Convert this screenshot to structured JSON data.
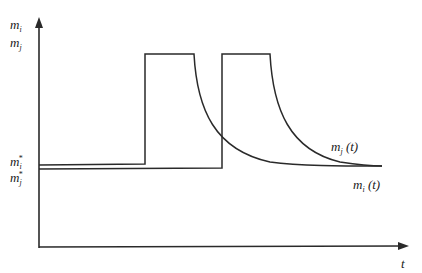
{
  "diagram": {
    "title": "",
    "axes": {
      "y_labels": [
        {
          "var": "m",
          "sub": "i"
        },
        {
          "var": "m",
          "sub": "j"
        }
      ],
      "x_label": "t"
    },
    "baseline_labels": [
      {
        "var": "m",
        "sub": "i",
        "sup": "*"
      },
      {
        "var": "m",
        "sub": "j",
        "sup": "*"
      }
    ],
    "curve_labels": [
      {
        "var": "m",
        "sub": "j",
        "arg": "(t)"
      },
      {
        "var": "m",
        "sub": "i",
        "arg": "(t)"
      }
    ],
    "colors": {
      "line": "#2a2a2a",
      "text": "#1a1a1a",
      "background": "#ffffff"
    }
  }
}
